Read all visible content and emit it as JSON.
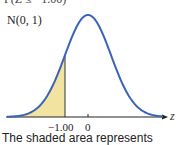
{
  "chart_data": {
    "type": "area",
    "title": "",
    "distribution_label": "N(0, 1)",
    "top_text_clipped": "P(Z ≤ −1.00)",
    "xlabel": "z",
    "ylabel": "",
    "x_ticks": [
      {
        "value": -1.0,
        "label": "−1.00"
      },
      {
        "value": 0,
        "label": "0"
      }
    ],
    "curve": {
      "mean": 0,
      "sd": 1,
      "color": "#3a63b8"
    },
    "shaded_region": {
      "from": "-inf",
      "to": -1.0,
      "color": "#f3e3a0"
    },
    "xlim": [
      -3.5,
      3.5
    ],
    "grid": false,
    "legend": null
  },
  "labels": {
    "top_clipped": "P(Z ≤ −1.00)",
    "distribution": "N(0, 1)",
    "tick_neg1": "−1.00",
    "tick_zero": "0",
    "axis_z": "z",
    "caption": "The shaded area represents"
  },
  "colors": {
    "curve": "#3a63b8",
    "shade": "#f3e3a0",
    "axis": "#222222"
  }
}
